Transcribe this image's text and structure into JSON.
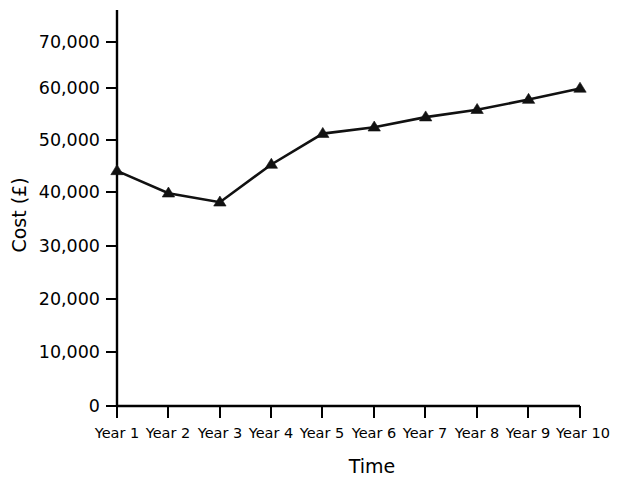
{
  "chart_data": {
    "type": "line",
    "title": "",
    "subtitle": "",
    "xlabel": "Time",
    "ylabel": "Cost (£)",
    "categories": [
      "Year 1",
      "Year 2",
      "Year 3",
      "Year 4",
      "Year 5",
      "Year 6",
      "Year 7",
      "Year 8",
      "Year 9",
      "Year 10"
    ],
    "values": [
      44200,
      40000,
      38300,
      45400,
      51200,
      52400,
      54300,
      55700,
      57600,
      59700
    ],
    "series": [
      {
        "name": "Cost",
        "values": [
          44200,
          40000,
          38300,
          45400,
          51200,
          52400,
          54300,
          55700,
          57600,
          59700
        ],
        "marker": "triangle",
        "color": "#111111"
      }
    ],
    "ylim": [
      0,
      75000
    ],
    "yticks": [
      0,
      10000,
      20000,
      30000,
      40000,
      50000,
      60000,
      70000
    ],
    "ytick_labels": [
      "0",
      "10,000",
      "20,000",
      "30,000",
      "40,000",
      "50,000",
      "60,000",
      "70,000"
    ],
    "grid": false,
    "legend": false,
    "legend_position": "none",
    "line_color": "#111111",
    "axis_color": "#000000",
    "background_color": "#ffffff"
  }
}
